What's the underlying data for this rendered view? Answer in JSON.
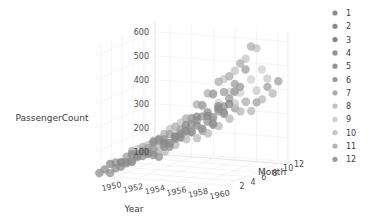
{
  "chart_data": {
    "type": "scatter",
    "title": "",
    "projection": "3d",
    "xlabel": "Year",
    "ylabel": "PassengerCount",
    "zlabel": "Month",
    "x_ticks": [
      "1950",
      "1952",
      "1954",
      "1956",
      "1958",
      "1960"
    ],
    "x_tick_values": [
      1950,
      1952,
      1954,
      1956,
      1958,
      1960
    ],
    "y_ticks": [
      "100",
      "200",
      "300",
      "400",
      "500",
      "600"
    ],
    "y_tick_values": [
      100,
      200,
      300,
      400,
      500,
      600
    ],
    "z_ticks": [
      "2",
      "4",
      "6",
      "8",
      "10",
      "12"
    ],
    "z_tick_values": [
      2,
      4,
      6,
      8,
      10,
      12
    ],
    "xlim": [
      1948.6,
      1960.9
    ],
    "ylim": [
      90,
      640
    ],
    "zlim": [
      1,
      12
    ],
    "grid": true,
    "legend_title": "",
    "legend_position": "right",
    "legend_entries": [
      {
        "label": "1",
        "color": "#8c8c8c"
      },
      {
        "label": "2",
        "color": "#898989"
      },
      {
        "label": "3",
        "color": "#858585"
      },
      {
        "label": "4",
        "color": "#8f8f8f"
      },
      {
        "label": "5",
        "color": "#959595"
      },
      {
        "label": "6",
        "color": "#9b9b9b"
      },
      {
        "label": "7",
        "color": "#ababab"
      },
      {
        "label": "8",
        "color": "#c2c2c2"
      },
      {
        "label": "9",
        "color": "#cfcfcf"
      },
      {
        "label": "10",
        "color": "#c6c6c6"
      },
      {
        "label": "11",
        "color": "#b4b4b4"
      },
      {
        "label": "12",
        "color": "#9d9d9d"
      }
    ],
    "series": [
      {
        "name": "Month 1",
        "color": "#8c8c8c",
        "x": [
          1949,
          1950,
          1951,
          1952,
          1953,
          1954,
          1955,
          1956,
          1957,
          1958,
          1959,
          1960
        ],
        "y": [
          112,
          115,
          145,
          171,
          196,
          204,
          242,
          284,
          315,
          340,
          360,
          417
        ],
        "z": [
          1,
          1,
          1,
          1,
          1,
          1,
          1,
          1,
          1,
          1,
          1,
          1
        ]
      },
      {
        "name": "Month 2",
        "color": "#898989",
        "x": [
          1949,
          1950,
          1951,
          1952,
          1953,
          1954,
          1955,
          1956,
          1957,
          1958,
          1959,
          1960
        ],
        "y": [
          118,
          126,
          150,
          180,
          196,
          188,
          233,
          277,
          301,
          318,
          342,
          391
        ],
        "z": [
          2,
          2,
          2,
          2,
          2,
          2,
          2,
          2,
          2,
          2,
          2,
          2
        ]
      },
      {
        "name": "Month 3",
        "color": "#858585",
        "x": [
          1949,
          1950,
          1951,
          1952,
          1953,
          1954,
          1955,
          1956,
          1957,
          1958,
          1959,
          1960
        ],
        "y": [
          132,
          141,
          178,
          193,
          236,
          235,
          267,
          317,
          356,
          362,
          406,
          419
        ],
        "z": [
          3,
          3,
          3,
          3,
          3,
          3,
          3,
          3,
          3,
          3,
          3,
          3
        ]
      },
      {
        "name": "Month 4",
        "color": "#8f8f8f",
        "x": [
          1949,
          1950,
          1951,
          1952,
          1953,
          1954,
          1955,
          1956,
          1957,
          1958,
          1959,
          1960
        ],
        "y": [
          129,
          135,
          163,
          181,
          235,
          227,
          269,
          313,
          348,
          348,
          396,
          461
        ],
        "z": [
          4,
          4,
          4,
          4,
          4,
          4,
          4,
          4,
          4,
          4,
          4,
          4
        ]
      },
      {
        "name": "Month 5",
        "color": "#959595",
        "x": [
          1949,
          1950,
          1951,
          1952,
          1953,
          1954,
          1955,
          1956,
          1957,
          1958,
          1959,
          1960
        ],
        "y": [
          121,
          125,
          172,
          183,
          229,
          234,
          270,
          318,
          355,
          363,
          420,
          472
        ],
        "z": [
          5,
          5,
          5,
          5,
          5,
          5,
          5,
          5,
          5,
          5,
          5,
          5
        ]
      },
      {
        "name": "Month 6",
        "color": "#9b9b9b",
        "x": [
          1949,
          1950,
          1951,
          1952,
          1953,
          1954,
          1955,
          1956,
          1957,
          1958,
          1959,
          1960
        ],
        "y": [
          135,
          149,
          178,
          218,
          243,
          264,
          315,
          374,
          422,
          435,
          472,
          535
        ],
        "z": [
          6,
          6,
          6,
          6,
          6,
          6,
          6,
          6,
          6,
          6,
          6,
          6
        ]
      },
      {
        "name": "Month 7",
        "color": "#ababab",
        "x": [
          1949,
          1950,
          1951,
          1952,
          1953,
          1954,
          1955,
          1956,
          1957,
          1958,
          1959,
          1960
        ],
        "y": [
          148,
          170,
          199,
          230,
          264,
          302,
          364,
          413,
          465,
          491,
          548,
          622
        ],
        "z": [
          7,
          7,
          7,
          7,
          7,
          7,
          7,
          7,
          7,
          7,
          7,
          7
        ]
      },
      {
        "name": "Month 8",
        "color": "#c2c2c2",
        "x": [
          1949,
          1950,
          1951,
          1952,
          1953,
          1954,
          1955,
          1956,
          1957,
          1958,
          1959,
          1960
        ],
        "y": [
          148,
          170,
          199,
          242,
          272,
          293,
          347,
          405,
          467,
          505,
          559,
          606
        ],
        "z": [
          8,
          8,
          8,
          8,
          8,
          8,
          8,
          8,
          8,
          8,
          8,
          8
        ]
      },
      {
        "name": "Month 9",
        "color": "#cfcfcf",
        "x": [
          1949,
          1950,
          1951,
          1952,
          1953,
          1954,
          1955,
          1956,
          1957,
          1958,
          1959,
          1960
        ],
        "y": [
          136,
          158,
          184,
          209,
          237,
          259,
          312,
          355,
          404,
          404,
          463,
          508
        ],
        "z": [
          9,
          9,
          9,
          9,
          9,
          9,
          9,
          9,
          9,
          9,
          9,
          9
        ]
      },
      {
        "name": "Month 10",
        "color": "#c6c6c6",
        "x": [
          1949,
          1950,
          1951,
          1952,
          1953,
          1954,
          1955,
          1956,
          1957,
          1958,
          1959,
          1960
        ],
        "y": [
          119,
          133,
          162,
          191,
          211,
          229,
          274,
          306,
          347,
          359,
          407,
          461
        ],
        "z": [
          10,
          10,
          10,
          10,
          10,
          10,
          10,
          10,
          10,
          10,
          10,
          10
        ]
      },
      {
        "name": "Month 11",
        "color": "#b4b4b4",
        "x": [
          1949,
          1950,
          1951,
          1952,
          1953,
          1954,
          1955,
          1956,
          1957,
          1958,
          1959,
          1960
        ],
        "y": [
          104,
          114,
          146,
          172,
          180,
          203,
          237,
          271,
          305,
          310,
          362,
          390
        ],
        "z": [
          11,
          11,
          11,
          11,
          11,
          11,
          11,
          11,
          11,
          11,
          11,
          11
        ]
      },
      {
        "name": "Month 12",
        "color": "#9d9d9d",
        "x": [
          1949,
          1950,
          1951,
          1952,
          1953,
          1954,
          1955,
          1956,
          1957,
          1958,
          1959,
          1960
        ],
        "y": [
          118,
          140,
          166,
          194,
          201,
          229,
          278,
          306,
          336,
          337,
          405,
          432
        ],
        "z": [
          12,
          12,
          12,
          12,
          12,
          12,
          12,
          12,
          12,
          12,
          12,
          12
        ]
      }
    ]
  },
  "colors": {
    "background": "#ffffff",
    "grid": "#e8e8e8",
    "text": "#3d3d3d",
    "tick": "#4a4a4a"
  }
}
